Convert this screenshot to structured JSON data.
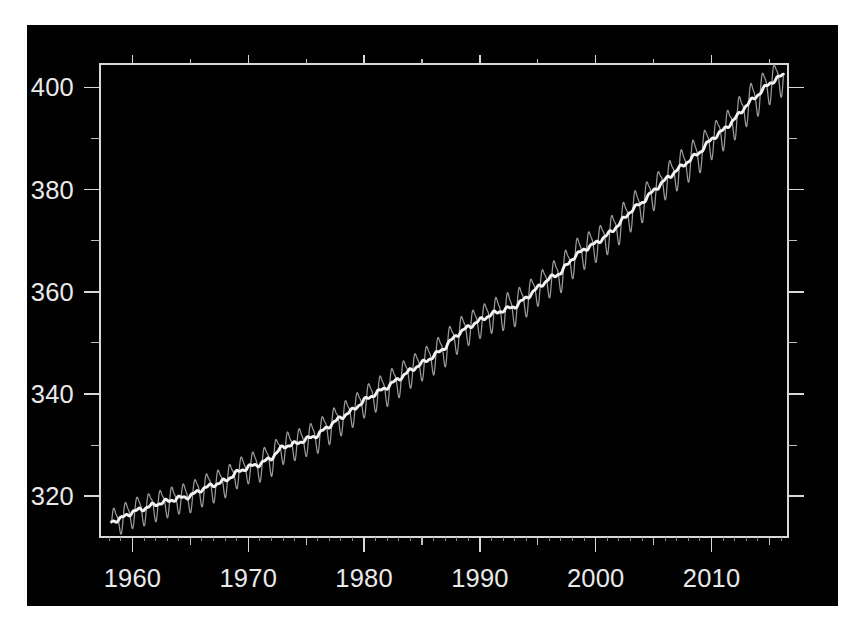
{
  "figure": {
    "background_color": "#ffffff",
    "panel_color": "#010101",
    "panel_rect": {
      "x": 27,
      "y": 25,
      "width": 811,
      "height": 581
    }
  },
  "chart_data": {
    "type": "line",
    "title": "",
    "subtitle": "",
    "xlabel": "",
    "ylabel": "",
    "xlim": [
      1957.2,
      2016.6
    ],
    "ylim": [
      312.0,
      404.6
    ],
    "grid": false,
    "legend_position": "none",
    "axis": {
      "x_major_ticks": [
        1960,
        1970,
        1980,
        1990,
        2000,
        2010
      ],
      "x_major_tick_labels": [
        "1960",
        "1970",
        "1980",
        "1990",
        "2000",
        "2010"
      ],
      "x_minor_ticks": [
        1965,
        1975,
        1985,
        1995,
        2005,
        2015
      ],
      "x_micro_tick_step": 1,
      "y_major_ticks": [
        320,
        340,
        360,
        380,
        400
      ],
      "y_major_tick_labels": [
        "320",
        "340",
        "360",
        "380",
        "400"
      ],
      "y_minor_ticks": [
        330,
        350,
        370,
        390
      ],
      "tick_direction": "out",
      "frame": "full-box"
    },
    "colors": {
      "seasonal_series": "#9a9a9a",
      "trend_series": "#f2f2f2",
      "axis": "#d8d8d8",
      "tick_label": "#e9e9e9"
    },
    "series": [
      {
        "name": "Monthly mean (seasonal cycle)",
        "style": "thin-gray-line",
        "seasonal_amplitude_start": 2.6,
        "seasonal_amplitude_end": 3.4,
        "seasonal_peak_month": 5,
        "seasonal_trough_month": 9
      },
      {
        "name": "Seasonally adjusted trend",
        "style": "thick-white-line"
      }
    ],
    "x": [
      1958.2,
      1959,
      1960,
      1961,
      1962,
      1963,
      1964,
      1965,
      1966,
      1967,
      1968,
      1969,
      1970,
      1971,
      1972,
      1973,
      1974,
      1975,
      1976,
      1977,
      1978,
      1979,
      1980,
      1981,
      1982,
      1983,
      1984,
      1985,
      1986,
      1987,
      1988,
      1989,
      1990,
      1991,
      1992,
      1993,
      1994,
      1995,
      1996,
      1997,
      1998,
      1999,
      2000,
      2001,
      2002,
      2003,
      2004,
      2005,
      2006,
      2007,
      2008,
      2009,
      2010,
      2011,
      2012,
      2013,
      2014,
      2015,
      2016.2
    ],
    "values": [
      315.0,
      315.6,
      316.9,
      317.6,
      318.4,
      319.0,
      319.6,
      320.0,
      321.4,
      322.2,
      323.0,
      324.6,
      325.7,
      326.3,
      327.5,
      329.7,
      330.2,
      331.1,
      332.0,
      333.8,
      335.4,
      336.8,
      338.7,
      340.1,
      341.4,
      343.0,
      344.6,
      346.0,
      347.4,
      349.2,
      351.6,
      353.1,
      354.4,
      355.6,
      356.4,
      357.1,
      358.8,
      360.8,
      362.6,
      363.8,
      366.6,
      368.3,
      369.5,
      371.1,
      373.2,
      375.8,
      377.5,
      379.8,
      381.9,
      383.8,
      385.6,
      387.4,
      389.9,
      391.6,
      393.8,
      396.5,
      398.6,
      400.8,
      402.5
    ],
    "units": "ppm",
    "data_start_year": 1958.2,
    "data_end_year": 2016.2,
    "data_start_value": 315.0,
    "data_end_value": 402.5
  }
}
